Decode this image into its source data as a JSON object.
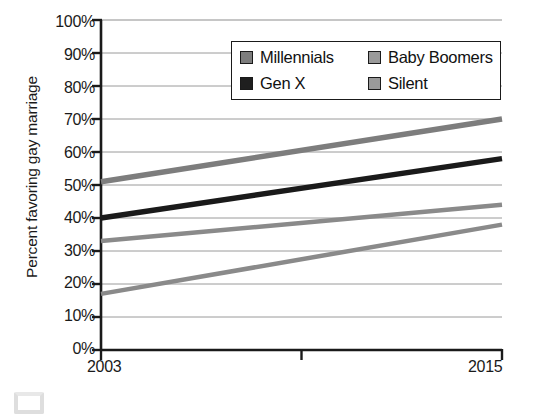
{
  "chart_data": {
    "type": "line",
    "title": "",
    "xlabel": "",
    "ylabel": "Percent favoring gay marriage",
    "x": [
      2003,
      2015
    ],
    "xtick_labels": [
      "2003",
      "2015"
    ],
    "xlim": [
      2003,
      2015
    ],
    "ylim": [
      0,
      100
    ],
    "ytick_labels": [
      "100%",
      "90%",
      "80%",
      "70%",
      "60%",
      "50%",
      "40%",
      "30%",
      "20%",
      "10%",
      "0%"
    ],
    "ytick_values": [
      100,
      90,
      80,
      70,
      60,
      50,
      40,
      30,
      20,
      10,
      0
    ],
    "grid": true,
    "legend_position": "top-right-inside",
    "series": [
      {
        "name": "Millennials",
        "values": [
          51,
          70
        ],
        "color": "#7d7d7d",
        "width": 5.5
      },
      {
        "name": "Gen X",
        "values": [
          40,
          58
        ],
        "color": "#1a1a1a",
        "width": 5.5
      },
      {
        "name": "Baby Boomers",
        "values": [
          33,
          44
        ],
        "color": "#8a8a8a",
        "width": 4.5
      },
      {
        "name": "Silent",
        "values": [
          17,
          38
        ],
        "color": "#8a8a8a",
        "width": 4.5
      }
    ]
  },
  "axis": {
    "y_title": "Percent favoring gay marriage",
    "y_ticks": [
      "100%",
      "90%",
      "80%",
      "70%",
      "60%",
      "50%",
      "40%",
      "30%",
      "20%",
      "10%",
      "0%"
    ],
    "x_tick_start": "2003",
    "x_tick_end": "2015"
  },
  "legend": {
    "items": [
      {
        "label": "Millennials",
        "swatch": "#7d7d7d"
      },
      {
        "label": "Baby Boomers",
        "swatch": "#9a9a9a"
      },
      {
        "label": "Gen X",
        "swatch": "#1f1f1f"
      },
      {
        "label": "Silent",
        "swatch": "#9a9a9a"
      }
    ]
  },
  "colors": {
    "axis": "#1a1a1a",
    "grid": "#8e8e8e",
    "background": "#ffffff",
    "text": "#1a1a1a"
  }
}
